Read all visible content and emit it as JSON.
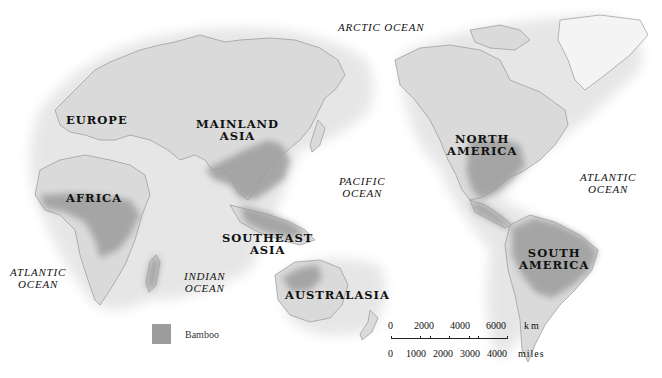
{
  "map": {
    "title_visible": false,
    "style": "grayscale relief world map, Pacific-centered",
    "colors": {
      "background": "#ffffff",
      "land": "#d9d9d9",
      "land_light": "#ececec",
      "bamboo": "#9c9c9c",
      "coastline": "#8a8a8a",
      "label_text": "#111111"
    },
    "continent_labels": [
      {
        "id": "europe",
        "lines": [
          "EUROPE"
        ]
      },
      {
        "id": "mainland-asia",
        "lines": [
          "MAINLAND",
          "ASIA"
        ]
      },
      {
        "id": "africa",
        "lines": [
          "AFRICA"
        ]
      },
      {
        "id": "southeast-asia",
        "lines": [
          "SOUTHEAST",
          "ASIA"
        ]
      },
      {
        "id": "australasia",
        "lines": [
          "AUSTRALASIA"
        ]
      },
      {
        "id": "north-america",
        "lines": [
          "NORTH",
          "AMERICA"
        ]
      },
      {
        "id": "south-america",
        "lines": [
          "SOUTH",
          "AMERICA"
        ]
      }
    ],
    "ocean_labels": [
      {
        "id": "arctic",
        "lines": [
          "ARCTIC OCEAN"
        ]
      },
      {
        "id": "pacific",
        "lines": [
          "PACIFIC",
          "OCEAN"
        ]
      },
      {
        "id": "atlantic-east",
        "lines": [
          "ATLANTIC",
          "OCEAN"
        ]
      },
      {
        "id": "atlantic-west",
        "lines": [
          "ATLANTIC",
          "OCEAN"
        ]
      },
      {
        "id": "indian",
        "lines": [
          "INDIAN",
          "OCEAN"
        ]
      }
    ],
    "legend": {
      "items": [
        {
          "label": "Bamboo",
          "color": "#9c9c9c"
        }
      ]
    },
    "scale_bar": {
      "km_ticks": [
        "0",
        "2000",
        "4000",
        "6000"
      ],
      "km_unit": "km",
      "miles_ticks": [
        "0",
        "1000",
        "2000",
        "3000",
        "4000"
      ],
      "miles_unit": "miles"
    }
  }
}
